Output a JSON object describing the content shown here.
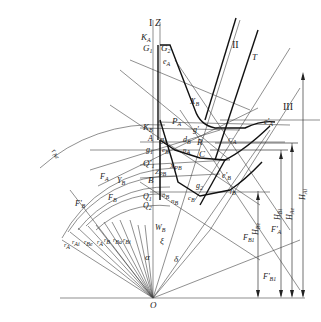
{
  "diagram": {
    "type": "technical-drawing",
    "axis_labels": {
      "axis_I": "I",
      "axis_Z": "Z",
      "line_II": "II",
      "line_III": "III",
      "line_T": "T"
    },
    "top_labels": {
      "KA": "K",
      "KA_sub": "A",
      "G1": "G",
      "G1_sub": "1",
      "G2": "G",
      "G2_sub": "2",
      "eA": "e",
      "eA_sub": "A",
      "XB": "X",
      "XB_sub": "B"
    },
    "mid_labels": {
      "PA": "P",
      "PA_sub": "A",
      "KB": "K",
      "KB_sub": "B",
      "A": "A",
      "g2": "g",
      "g2_sub": "2",
      "dB": "d",
      "dB_sub": "B",
      "gprime": "g'",
      "g1": "g",
      "g1_sub": "1",
      "eB_small": "e",
      "eB_small_sub": "B",
      "nA": "n",
      "nA_sub": "A",
      "R": "R",
      "C": "C",
      "CA": "C",
      "CA_sub": "A",
      "ePrimeA": "e'",
      "ePrimeA_sub": "A",
      "Q1prime": "Q'",
      "Q1prime_sub": "1",
      "XPB": "X",
      "XPB_sub": "PB",
      "ZPB": "Z",
      "ZPB_sub": "PB",
      "B": "B",
      "Q1": "Q",
      "Q1_sub": "1",
      "Q2": "Q",
      "Q2_sub": "2",
      "oB": "o",
      "oB_sub": "B",
      "nB": "n",
      "nB_sub": "B",
      "cB": "c",
      "cB_sub": "B",
      "g2b": "g",
      "g2b_sub": "2",
      "ePrimeB": "e'",
      "ePrimeB_sub": "B",
      "fB": "f",
      "fB_sub": "B"
    },
    "left_labels": {
      "rAe": "r",
      "rAe_sub": "Ae",
      "FA": "F",
      "FA_sub": "A",
      "YB": "Y",
      "YB_sub": "B",
      "FprimeB": "F'",
      "FprimeB_sub": "B",
      "FB": "F",
      "FB_sub": "B",
      "rA": "r",
      "rA_sub": "A",
      "rAi": "r",
      "rAi_sub": "Ai",
      "rBe": "r",
      "rBe_sub": "Be",
      "rAo": "r",
      "rAo_sub": "A",
      "rB": "r",
      "rB_sub": "B",
      "rBa": "r",
      "rBa_sub": "Ba",
      "rBi": "r",
      "rBi_sub": "Bi"
    },
    "angle_labels": {
      "WB": "W",
      "WB_sub": "B",
      "xi": "ξ",
      "alpha": "α",
      "delta": "δ",
      "origin": "O"
    },
    "right_labels": {
      "HAi": "H",
      "HAi_sub": "Ai",
      "HAe": "H",
      "HAe_sub": "Ae",
      "HBi": "H",
      "HBi_sub": "Bi",
      "HBe": "H",
      "HBe_sub": "Be",
      "FprimeA": "F'",
      "FprimeA_sub": "A",
      "FB1": "F",
      "FB1_sub": "B1",
      "FprimeB1": "F'",
      "FprimeB1_sub": "B1"
    },
    "colors": {
      "line": "#333333",
      "thick": "#111111",
      "background": "#ffffff"
    }
  }
}
